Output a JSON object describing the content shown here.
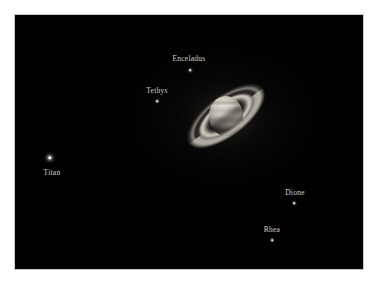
{
  "image": {
    "subject": "Saturn",
    "background_color": "#000000",
    "page_color": "#ffffff",
    "border_color": "#c9c9c9",
    "label_color": "#d4d1cb"
  },
  "planet": {
    "name": "Saturn",
    "ring_tilt_degrees": -37,
    "body_color": "#cfc9bd",
    "ring_color": "#d6d1c4",
    "features": [
      "cassini-division",
      "ring-shadow",
      "cloud-bands"
    ]
  },
  "moons": [
    {
      "label": "Enceladus",
      "label_x": 189,
      "label_y": 54,
      "dot_x": 190,
      "dot_y": 70,
      "size": "sm",
      "brightness": "faint"
    },
    {
      "label": "Tethys",
      "label_x": 157,
      "label_y": 86,
      "dot_x": 157,
      "dot_y": 101,
      "size": "sm",
      "brightness": "faint"
    },
    {
      "label": "Titan",
      "label_x": 52,
      "label_y": 168,
      "dot_x": 50,
      "dot_y": 158,
      "size": "lg",
      "brightness": "bright"
    },
    {
      "label": "Dione",
      "label_x": 295,
      "label_y": 188,
      "dot_x": 294,
      "dot_y": 203,
      "size": "sm",
      "brightness": "faint"
    },
    {
      "label": "Rhea",
      "label_x": 272,
      "label_y": 225,
      "dot_x": 272,
      "dot_y": 240,
      "size": "sm",
      "brightness": "faint"
    }
  ]
}
